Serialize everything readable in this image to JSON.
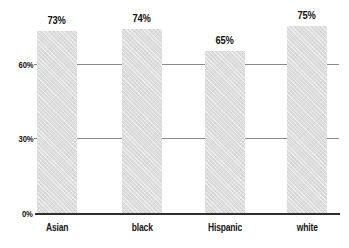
{
  "chart_data": {
    "type": "bar",
    "title": "",
    "xlabel": "",
    "ylabel": "",
    "categories": [
      "Asian",
      "black",
      "Hispanic",
      "white"
    ],
    "values": [
      73,
      74,
      65,
      75
    ],
    "value_labels": [
      "73%",
      "74%",
      "65%",
      "75%"
    ],
    "yticks": [
      {
        "value": 0,
        "label": "0%"
      },
      {
        "value": 30,
        "label": "30%"
      },
      {
        "value": 60,
        "label": "60%"
      }
    ],
    "ylim": [
      0,
      85
    ],
    "grid": "horizontal",
    "gridlines_behind_bars": true,
    "legend": "none",
    "colors": {
      "bar_fill": "#dcdcdc",
      "gridline": "#8a8a8a",
      "baseline": "#2e2e2e",
      "text": "#111111",
      "background": "#ffffff"
    }
  }
}
